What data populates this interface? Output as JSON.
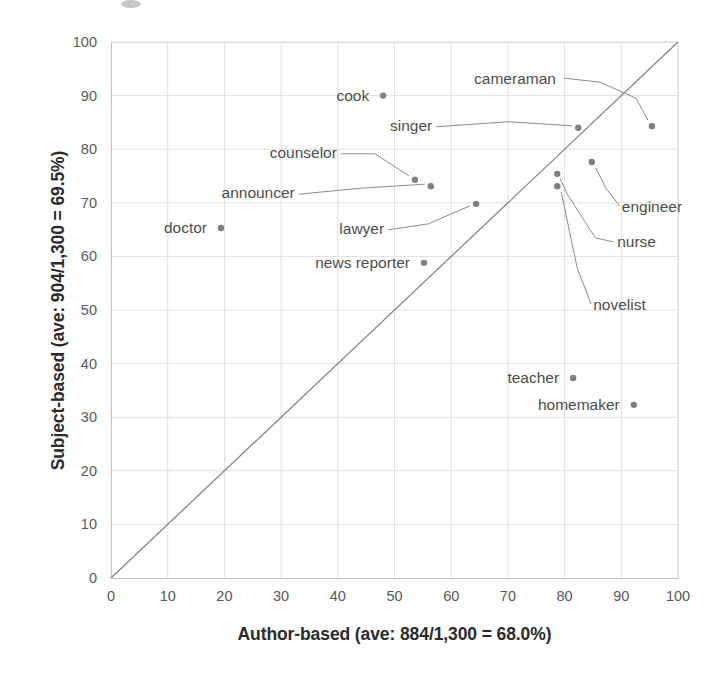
{
  "chart_data": {
    "type": "scatter",
    "title": "",
    "xlabel": "Author-based (ave: 884/1,300 = 68.0%)",
    "ylabel": "Subject-based (ave: 904/1,300 = 69.5%)",
    "xlim": [
      0,
      100
    ],
    "ylim": [
      0,
      100
    ],
    "xticks": [
      "0",
      "10",
      "20",
      "30",
      "40",
      "50",
      "60",
      "70",
      "80",
      "90",
      "100"
    ],
    "yticks": [
      "0",
      "10",
      "20",
      "30",
      "40",
      "50",
      "60",
      "70",
      "80",
      "90",
      "100"
    ],
    "grid": true,
    "legend": "none",
    "reference_line": {
      "name": "y = x diagonal",
      "from": [
        0,
        0
      ],
      "to": [
        100,
        100
      ],
      "color": "#808080"
    },
    "marker_color": "#808080",
    "points": [
      {
        "label": "cook",
        "x": 48.0,
        "y": 90.0,
        "label_side": "left",
        "leader": false
      },
      {
        "label": "doctor",
        "x": 19.4,
        "y": 65.3,
        "label_side": "left",
        "leader": false
      },
      {
        "label": "counselor",
        "x": 53.6,
        "y": 74.3,
        "label_side": "left",
        "leader": true
      },
      {
        "label": "announcer",
        "x": 56.4,
        "y": 73.1,
        "label_side": "left",
        "leader": true
      },
      {
        "label": "lawyer",
        "x": 64.4,
        "y": 69.8,
        "label_side": "left",
        "leader": true
      },
      {
        "label": "news reporter",
        "x": 55.2,
        "y": 58.8,
        "label_side": "left",
        "leader": false
      },
      {
        "label": "singer",
        "x": 82.4,
        "y": 84.0,
        "label_side": "left",
        "leader": true
      },
      {
        "label": "cameraman",
        "x": 95.4,
        "y": 84.3,
        "label_side": "left",
        "leader": true
      },
      {
        "label": "engineer",
        "x": 84.8,
        "y": 77.6,
        "label_side": "below",
        "leader": true
      },
      {
        "label": "nurse",
        "x": 78.7,
        "y": 75.4,
        "label_side": "below",
        "leader": true
      },
      {
        "label": "novelist",
        "x": 78.7,
        "y": 73.1,
        "label_side": "below",
        "leader": true
      },
      {
        "label": "teacher",
        "x": 81.5,
        "y": 37.3,
        "label_side": "left",
        "leader": false
      },
      {
        "label": "homemaker",
        "x": 92.2,
        "y": 32.3,
        "label_side": "left",
        "leader": false
      }
    ]
  },
  "axis": {
    "x_title": "Author-based (ave: 884/1,300 = 68.0%)",
    "y_title": "Subject-based (ave: 904/1,300 = 69.5%)"
  },
  "labels": {
    "cook": "cook",
    "doctor": "doctor",
    "counselor": "counselor",
    "announcer": "announcer",
    "lawyer": "lawyer",
    "news_reporter": "news reporter",
    "singer": "singer",
    "cameraman": "cameraman",
    "engineer": "engineer",
    "nurse": "nurse",
    "novelist": "novelist",
    "teacher": "teacher",
    "homemaker": "homemaker"
  },
  "ticks": {
    "x": [
      "0",
      "10",
      "20",
      "30",
      "40",
      "50",
      "60",
      "70",
      "80",
      "90",
      "100"
    ],
    "y": [
      "0",
      "10",
      "20",
      "30",
      "40",
      "50",
      "60",
      "70",
      "80",
      "90",
      "100"
    ]
  }
}
